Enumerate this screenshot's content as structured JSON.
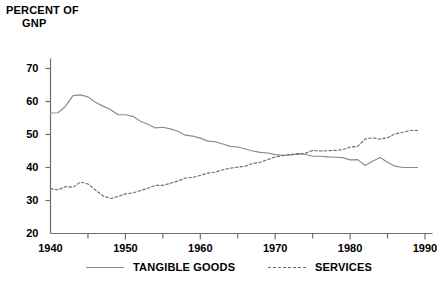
{
  "chart_data": {
    "type": "line",
    "title": "PERCENT OF GNP",
    "title_line1": "PERCENT OF",
    "title_line2": "GNP",
    "xlabel": "",
    "ylabel": "PERCENT OF GNP",
    "xlim": [
      1940,
      1991
    ],
    "ylim": [
      20,
      72
    ],
    "yticks": [
      20,
      30,
      40,
      50,
      60,
      70
    ],
    "ytick_labels": [
      "20",
      "30",
      "40",
      "50",
      "60",
      "70"
    ],
    "xticks": [
      1940,
      1950,
      1960,
      1970,
      1980,
      1990
    ],
    "xtick_labels": [
      "1940",
      "1950",
      "1960",
      "1970",
      "1980",
      "1990"
    ],
    "xminor_ticks": [
      1945,
      1955,
      1965,
      1975,
      1985
    ],
    "grid": false,
    "legend_position": "bottom",
    "line_color_tangible": "#8b8b8b",
    "line_color_services": "#6e6e6e",
    "axis_color": "#6e6e6e",
    "x": [
      1940,
      1941,
      1942,
      1943,
      1944,
      1945,
      1946,
      1947,
      1948,
      1949,
      1950,
      1951,
      1952,
      1953,
      1954,
      1955,
      1956,
      1957,
      1958,
      1959,
      1960,
      1961,
      1962,
      1963,
      1964,
      1965,
      1966,
      1967,
      1968,
      1969,
      1970,
      1971,
      1972,
      1973,
      1974,
      1975,
      1976,
      1977,
      1978,
      1979,
      1980,
      1981,
      1982,
      1983,
      1984,
      1985,
      1986,
      1987,
      1988,
      1989
    ],
    "series": [
      {
        "name": "TANGIBLE GOODS",
        "style": "solid",
        "color": "#8b8b8b",
        "values": [
          56.5,
          56.6,
          58.5,
          61.8,
          62.0,
          61.4,
          59.8,
          58.6,
          57.6,
          56.0,
          56.0,
          55.5,
          54.0,
          53.1,
          52.0,
          52.2,
          51.7,
          51.0,
          49.8,
          49.5,
          48.9,
          48.0,
          47.8,
          47.1,
          46.4,
          46.2,
          45.6,
          45.0,
          44.6,
          44.4,
          43.9,
          43.7,
          43.7,
          44.2,
          44.0,
          43.4,
          43.4,
          43.2,
          43.1,
          43.0,
          42.3,
          42.4,
          40.6,
          41.9,
          43.0,
          41.6,
          40.4,
          40.0,
          40.0,
          40.0
        ]
      },
      {
        "name": "SERVICES",
        "style": "dashed",
        "color": "#6e6e6e",
        "values": [
          33.6,
          33.2,
          34.2,
          34.0,
          35.6,
          35.0,
          33.2,
          31.4,
          30.6,
          31.2,
          32.0,
          32.3,
          33.0,
          33.7,
          34.6,
          34.6,
          35.2,
          35.9,
          36.8,
          37.0,
          37.6,
          38.3,
          38.6,
          39.3,
          39.8,
          40.1,
          40.4,
          41.2,
          41.6,
          42.4,
          43.2,
          43.6,
          44.0,
          44.0,
          44.3,
          45.2,
          45.0,
          45.1,
          45.2,
          45.4,
          46.2,
          46.4,
          48.6,
          49.0,
          48.6,
          49.0,
          50.2,
          50.6,
          51.2,
          51.2
        ]
      }
    ]
  },
  "legend": {
    "entries": [
      {
        "label": "TANGIBLE GOODS",
        "style": "solid"
      },
      {
        "label": "SERVICES",
        "style": "dashed"
      }
    ]
  }
}
